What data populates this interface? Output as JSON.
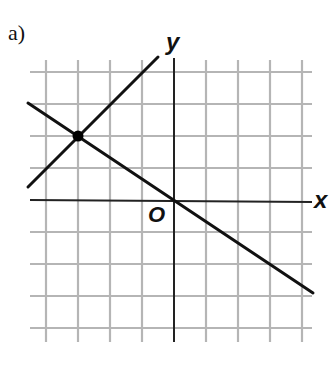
{
  "figure": {
    "part_label": "a)",
    "x_axis_label": "x",
    "y_axis_label": "y",
    "origin_label": "O"
  },
  "colors": {
    "grid": "#b5b5b5",
    "axis": "#222222",
    "line": "#111111",
    "point": "#000000",
    "background": "#ffffff"
  },
  "grid": {
    "x_range": [
      -4,
      4
    ],
    "y_range": [
      -4,
      4
    ],
    "unit_px": 32
  },
  "lines": [
    {
      "name": "line-1",
      "equation": "y = x + 5",
      "slope": 1,
      "intercept": 5
    },
    {
      "name": "line-2",
      "equation": "y = -2/3 x",
      "slope": -0.6667,
      "intercept": 0
    }
  ],
  "intersection_point": {
    "x": -3,
    "y": 2
  }
}
